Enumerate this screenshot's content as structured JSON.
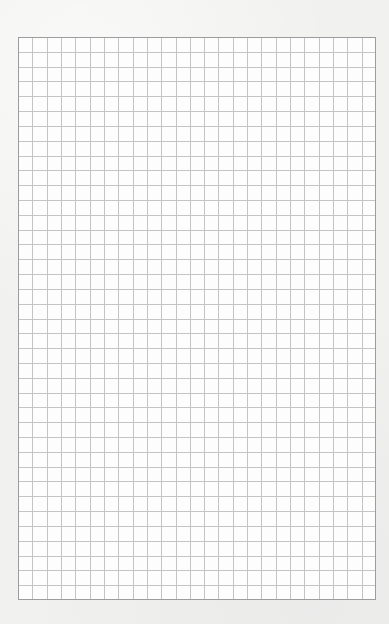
{
  "page": {
    "width": 389,
    "height": 624,
    "background_color": "#f1f1f0"
  },
  "graph_paper": {
    "left": 18,
    "top": 37,
    "width": 358,
    "height": 563,
    "columns": 25,
    "rows": 38,
    "paper_color": "#fdfdfd",
    "grid_line_color": "#c4c4c4",
    "border_color": "#9c9c9c"
  }
}
